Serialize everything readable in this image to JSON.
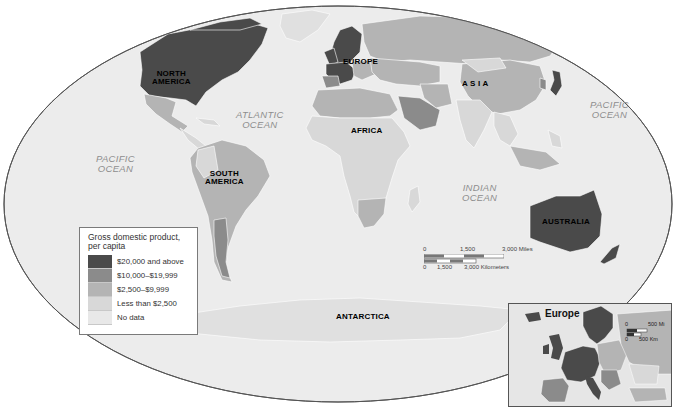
{
  "map": {
    "title": "World GDP per capita",
    "colors": {
      "background": "#ffffff",
      "ocean": "#ececec",
      "ellipse_border": "#555555",
      "tier1": "#4a4a4a",
      "tier2": "#8b8b8b",
      "tier3": "#b4b4b4",
      "tier4": "#d8d8d8",
      "no_data": "#e4e4e4",
      "country_border": "#ffffff"
    },
    "continents": [
      {
        "id": "north-america",
        "label": "NORTH\nAMERICA"
      },
      {
        "id": "south-america",
        "label": "SOUTH\nAMERICA"
      },
      {
        "id": "europe",
        "label": "EUROPE"
      },
      {
        "id": "africa",
        "label": "AFRICA"
      },
      {
        "id": "asia",
        "label": "A S I A"
      },
      {
        "id": "australia",
        "label": "AUSTRALIA"
      },
      {
        "id": "antarctica",
        "label": "ANTARCTICA"
      }
    ],
    "oceans": [
      {
        "id": "pacific-west",
        "label": "PACIFIC\nOCEAN"
      },
      {
        "id": "atlantic",
        "label": "ATLANTIC\nOCEAN"
      },
      {
        "id": "indian",
        "label": "INDIAN\nOCEAN"
      },
      {
        "id": "pacific-east",
        "label": "PACIFIC\nOCEAN"
      }
    ]
  },
  "legend": {
    "title": "Gross domestic product,\nper capita",
    "items": [
      {
        "label": "$20,000 and above",
        "color": "#4a4a4a"
      },
      {
        "label": "$10,000–$19,999",
        "color": "#8b8b8b"
      },
      {
        "label": "$2,500–$9,999",
        "color": "#b4b4b4"
      },
      {
        "label": "Less than $2,500",
        "color": "#d8d8d8"
      },
      {
        "label": "No data",
        "color": "#e8e8e8"
      }
    ]
  },
  "scale_bar": {
    "miles": {
      "ticks": [
        "0",
        "1,500",
        "3,000 Miles"
      ]
    },
    "kilometers": {
      "ticks": [
        "0",
        "1,500",
        "3,000 Kilometers"
      ]
    }
  },
  "inset": {
    "title": "Europe",
    "scale_miles": "500 Mi",
    "scale_km": "500 Km",
    "scale_zero": "0"
  }
}
